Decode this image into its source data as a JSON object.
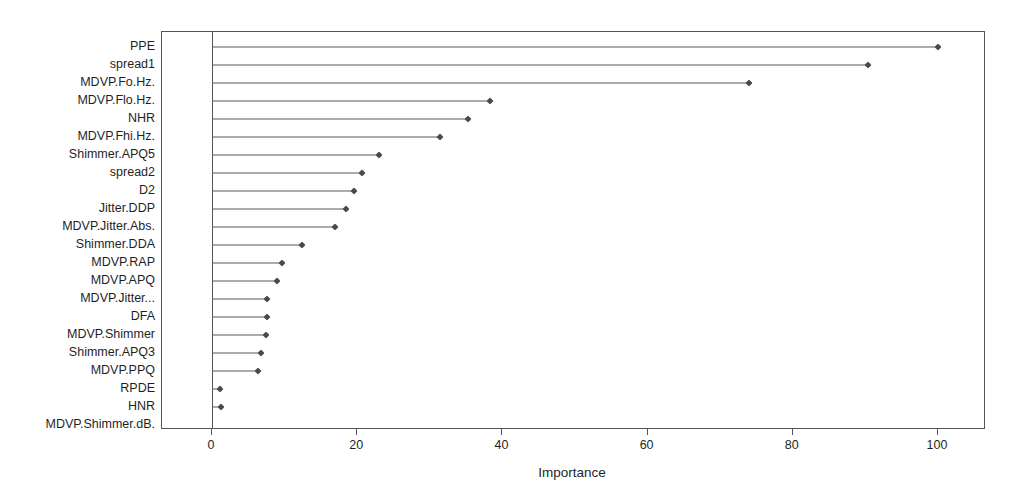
{
  "chart_data": {
    "type": "bar",
    "subtype": "lollipop-dotplot",
    "title": "",
    "subtitle": "",
    "xlabel": "Importance",
    "ylabel": "",
    "xlim": [
      0,
      107
    ],
    "ylim": [
      0,
      22
    ],
    "xticks": [
      0,
      20,
      40,
      60,
      80,
      100
    ],
    "xticklabels": [
      "0",
      "20",
      "40",
      "60",
      "80",
      "100"
    ],
    "grid": false,
    "legend": null,
    "orientation": "horizontal",
    "sorted": "descending",
    "categories": [
      "PPE",
      "spread1",
      "MDVP.Fo.Hz.",
      "MDVP.Flo.Hz.",
      "NHR",
      "MDVP.Fhi.Hz.",
      "Shimmer.APQ5",
      "spread2",
      "D2",
      "Jitter.DDP",
      "MDVP.Jitter.Abs.",
      "Shimmer.DDA",
      "MDVP.RAP",
      "MDVP.APQ",
      "MDVP.Jitter...",
      "DFA",
      "MDVP.Shimmer",
      "Shimmer.APQ3",
      "MDVP.PPQ",
      "RPDE",
      "HNR",
      "MDVP.Shimmer.dB."
    ],
    "values": [
      100.0,
      90.4,
      74.0,
      38.3,
      35.3,
      31.4,
      23.0,
      20.7,
      19.6,
      18.5,
      17.0,
      12.4,
      9.6,
      9.0,
      7.6,
      7.6,
      7.4,
      6.7,
      6.3,
      1.1,
      1.2,
      0.0
    ],
    "series": [
      {
        "name": "Importance",
        "values": [
          100.0,
          90.4,
          74.0,
          38.3,
          35.3,
          31.4,
          23.0,
          20.7,
          19.6,
          18.5,
          17.0,
          12.4,
          9.6,
          9.0,
          7.6,
          7.6,
          7.4,
          6.7,
          6.3,
          1.1,
          1.2,
          0.0
        ]
      }
    ],
    "colors": {
      "marker": "#4a4a4a",
      "line": "#5a5a5a",
      "axis": "#555555",
      "text": "#1f1f1f",
      "background": "#ffffff"
    }
  }
}
